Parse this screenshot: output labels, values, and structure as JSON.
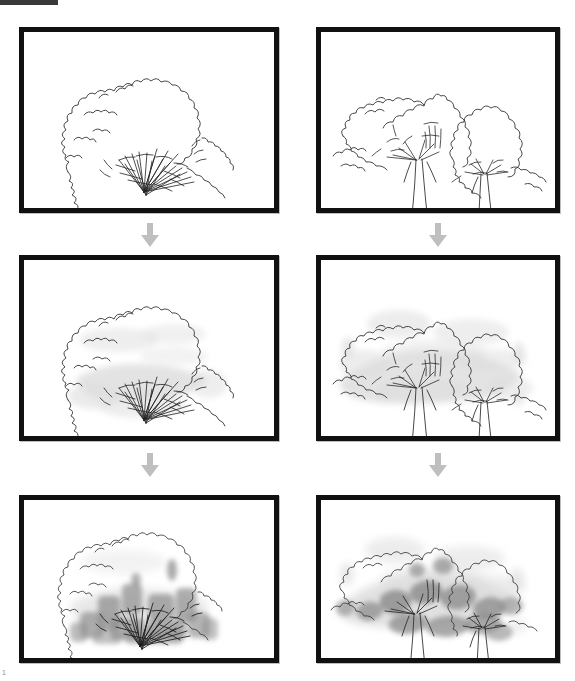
{
  "page": {
    "page_number": "1",
    "top_rule_color": "#3a3a3a",
    "background_color": "#ffffff",
    "frame_border_color": "#111111",
    "arrow_color": "#bfbfbf",
    "ink_color": "#333333",
    "wash_light_color": "#dedede",
    "wash_dark_color": "#8f8f8f"
  },
  "columns": [
    {
      "id": "left",
      "subject_label": "shrub-sketch"
    },
    {
      "id": "right",
      "subject_label": "tree-group-sketch"
    }
  ],
  "stages": [
    {
      "id": "outline",
      "label": "Line drawing"
    },
    {
      "id": "light-wash",
      "label": "Light wash"
    },
    {
      "id": "dark-wash",
      "label": "Dark shading"
    }
  ],
  "panels": [
    {
      "name": "shrub-outline",
      "row": 1,
      "column": "left",
      "stage": "outline",
      "caption": ""
    },
    {
      "name": "trees-outline",
      "row": 1,
      "column": "right",
      "stage": "outline",
      "caption": ""
    },
    {
      "name": "shrub-light-wash",
      "row": 2,
      "column": "left",
      "stage": "light-wash",
      "caption": ""
    },
    {
      "name": "trees-light-wash",
      "row": 2,
      "column": "right",
      "stage": "light-wash",
      "caption": ""
    },
    {
      "name": "shrub-dark-wash",
      "row": 3,
      "column": "left",
      "stage": "dark-wash",
      "caption": ""
    },
    {
      "name": "trees-dark-wash",
      "row": 3,
      "column": "right",
      "stage": "dark-wash",
      "caption": ""
    }
  ],
  "arrows": [
    {
      "name": "arrow-left-1",
      "from": "shrub-outline",
      "to": "shrub-light-wash",
      "direction": "down"
    },
    {
      "name": "arrow-right-1",
      "from": "trees-outline",
      "to": "trees-light-wash",
      "direction": "down"
    },
    {
      "name": "arrow-left-2",
      "from": "shrub-light-wash",
      "to": "shrub-dark-wash",
      "direction": "down"
    },
    {
      "name": "arrow-right-2",
      "from": "trees-light-wash",
      "to": "trees-dark-wash",
      "direction": "down"
    }
  ]
}
